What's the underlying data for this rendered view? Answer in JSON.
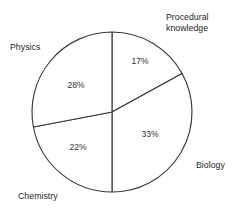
{
  "chart_data": {
    "type": "pie",
    "title": "",
    "subtitle": "",
    "xlabel": "",
    "ylabel": "",
    "legend_position": "none",
    "grid": false,
    "labels_outside": true,
    "start_angle_deg": 0,
    "direction": "clockwise",
    "categories": [
      "Procedural knowledge",
      "Biology",
      "Chemistry",
      "Physics"
    ],
    "values": [
      17,
      33,
      22,
      28
    ],
    "value_labels": [
      "17%",
      "33%",
      "22%",
      "28%"
    ],
    "unit": "%",
    "total": 100,
    "slices": [
      {
        "label": "Procedural knowledge",
        "value": 17,
        "value_label": "17%",
        "start_deg": 0,
        "end_deg": 61.2,
        "fill": "#ffffff",
        "stroke": "#3a3a3a",
        "label_lines": [
          "Procedural",
          "knowledge"
        ],
        "label_x": 166,
        "label_y": 20,
        "pct_x": 140,
        "pct_y": 64
      },
      {
        "label": "Biology",
        "value": 33,
        "value_label": "33%",
        "start_deg": 61.2,
        "end_deg": 180,
        "fill": "#ffffff",
        "stroke": "#3a3a3a",
        "label_lines": [
          "Biology"
        ],
        "label_x": 196,
        "label_y": 168,
        "pct_x": 150,
        "pct_y": 137
      },
      {
        "label": "Chemistry",
        "value": 22,
        "value_label": "22%",
        "start_deg": 180,
        "end_deg": 259.2,
        "fill": "#ffffff",
        "stroke": "#3a3a3a",
        "label_lines": [
          "Chemistry"
        ],
        "label_x": 18,
        "label_y": 199,
        "pct_x": 78,
        "pct_y": 150
      },
      {
        "label": "Physics",
        "value": 28,
        "value_label": "28%",
        "start_deg": 259.2,
        "end_deg": 360,
        "fill": "#ffffff",
        "stroke": "#3a3a3a",
        "label_lines": [
          "Physics"
        ],
        "label_x": 10,
        "label_y": 50,
        "pct_x": 76,
        "pct_y": 88
      }
    ],
    "geometry": {
      "center_x": 112,
      "center_y": 112,
      "radius": 80
    },
    "colors": {
      "background": "#ffffff",
      "slice_fill": "#ffffff",
      "outline": "#3a3a3a",
      "text": "#1f1f1f"
    }
  }
}
